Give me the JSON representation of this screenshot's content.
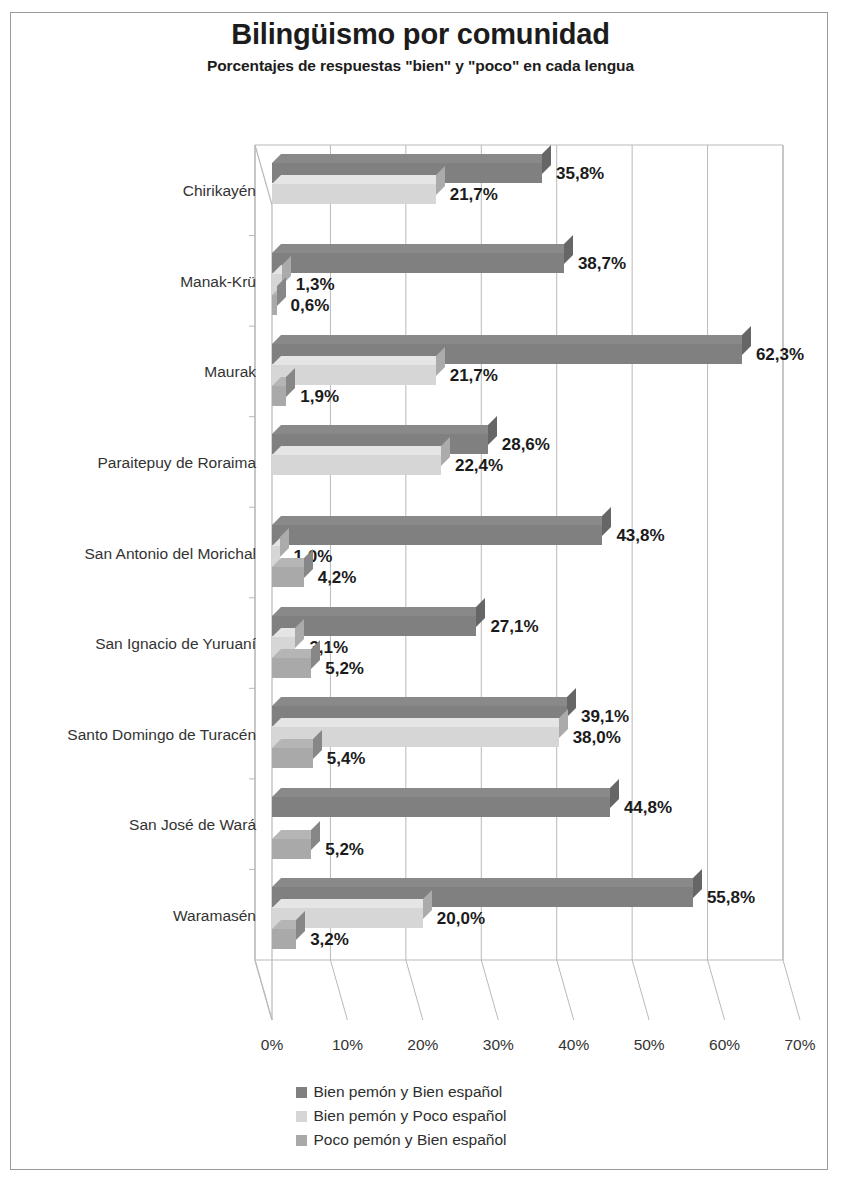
{
  "title": "Bilingüismo por comunidad",
  "subtitle": "Porcentajes de respuestas \"bien\" y \"poco\" en cada lengua",
  "legend": {
    "items": [
      {
        "label": "Bien pemón y Bien español",
        "color": "#808080"
      },
      {
        "label": "Bien pemón y Poco español",
        "color": "#d6d6d6"
      },
      {
        "label": "Poco pemón y Bien español",
        "color": "#a9a9a9"
      }
    ]
  },
  "chart_data": {
    "type": "bar",
    "orientation": "horizontal",
    "title": "Bilingüismo por comunidad",
    "subtitle": "Porcentajes de respuestas \"bien\" y \"poco\" en cada lengua",
    "xlabel": "",
    "ylabel": "",
    "xlim": [
      0,
      70
    ],
    "xticks": [
      "0%",
      "10%",
      "20%",
      "30%",
      "40%",
      "50%",
      "60%",
      "70%"
    ],
    "xtick_values": [
      0,
      10,
      20,
      30,
      40,
      50,
      60,
      70
    ],
    "grid": true,
    "legend_position": "bottom",
    "value_suffix": "%",
    "decimal_separator": ",",
    "categories": [
      "Chirikayén",
      "Manak-Krü",
      "Maurak",
      "Paraitepuy de Roraima",
      "San Antonio del Morichal",
      "San Ignacio de Yuruaní",
      "Santo Domingo de Turacén",
      "San José de Wará",
      "Waramasén"
    ],
    "series": [
      {
        "name": "Bien pemón y Bien español",
        "color": "#808080",
        "values": [
          35.8,
          38.7,
          62.3,
          28.6,
          43.8,
          27.1,
          39.1,
          44.8,
          55.8
        ],
        "labels": [
          "35,8%",
          "38,7%",
          "62,3%",
          "28,6%",
          "43,8%",
          "27,1%",
          "39,1%",
          "44,8%",
          "55,8%"
        ]
      },
      {
        "name": "Bien pemón y Poco español",
        "color": "#d6d6d6",
        "values": [
          21.7,
          1.3,
          21.7,
          22.4,
          1.0,
          3.1,
          38.0,
          0.0,
          20.0
        ],
        "labels": [
          "21,7%",
          "1,3%",
          "21,7%",
          "22,4%",
          "1,0%",
          "3,1%",
          "38,0%",
          "",
          "20,0%"
        ]
      },
      {
        "name": "Poco pemón y Bien español",
        "color": "#a9a9a9",
        "values": [
          0.0,
          0.6,
          1.9,
          0.0,
          4.2,
          5.2,
          5.4,
          5.2,
          3.2
        ],
        "labels": [
          "",
          "0,6%",
          "1,9%",
          "",
          "4,2%",
          "5,2%",
          "5,4%",
          "5,2%",
          "3,2%"
        ]
      }
    ]
  }
}
